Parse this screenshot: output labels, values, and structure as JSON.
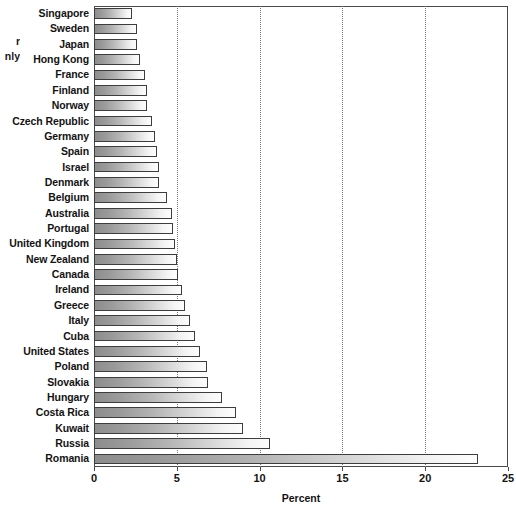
{
  "caption_fragment": {
    "line1": "r",
    "line2": "nly"
  },
  "chart_data": {
    "type": "bar",
    "orientation": "horizontal",
    "title": "",
    "xlabel": "Percent",
    "ylabel": "",
    "xlim": [
      0,
      25
    ],
    "xticks": [
      0,
      5,
      10,
      15,
      20,
      25
    ],
    "xticklabels": [
      "0",
      "5",
      "10",
      "15",
      "20",
      "25"
    ],
    "gridlines": [
      5,
      10,
      15,
      20
    ],
    "grid": true,
    "legend": null,
    "categories": [
      "Singapore",
      "Sweden",
      "Japan",
      "Hong Kong",
      "France",
      "Finland",
      "Norway",
      "Czech Republic",
      "Germany",
      "Spain",
      "Israel",
      "Denmark",
      "Belgium",
      "Australia",
      "Portugal",
      "United Kingdom",
      "New Zealand",
      "Canada",
      "Ireland",
      "Greece",
      "Italy",
      "Cuba",
      "United States",
      "Poland",
      "Slovakia",
      "Hungary",
      "Costa Rica",
      "Kuwait",
      "Russia",
      "Romania"
    ],
    "values": [
      2.3,
      2.6,
      2.6,
      2.8,
      3.1,
      3.2,
      3.2,
      3.5,
      3.7,
      3.8,
      3.9,
      3.9,
      4.4,
      4.7,
      4.8,
      4.9,
      5.0,
      5.1,
      5.3,
      5.5,
      5.8,
      6.1,
      6.4,
      6.8,
      6.9,
      7.7,
      8.6,
      9.0,
      10.6,
      23.2
    ]
  }
}
